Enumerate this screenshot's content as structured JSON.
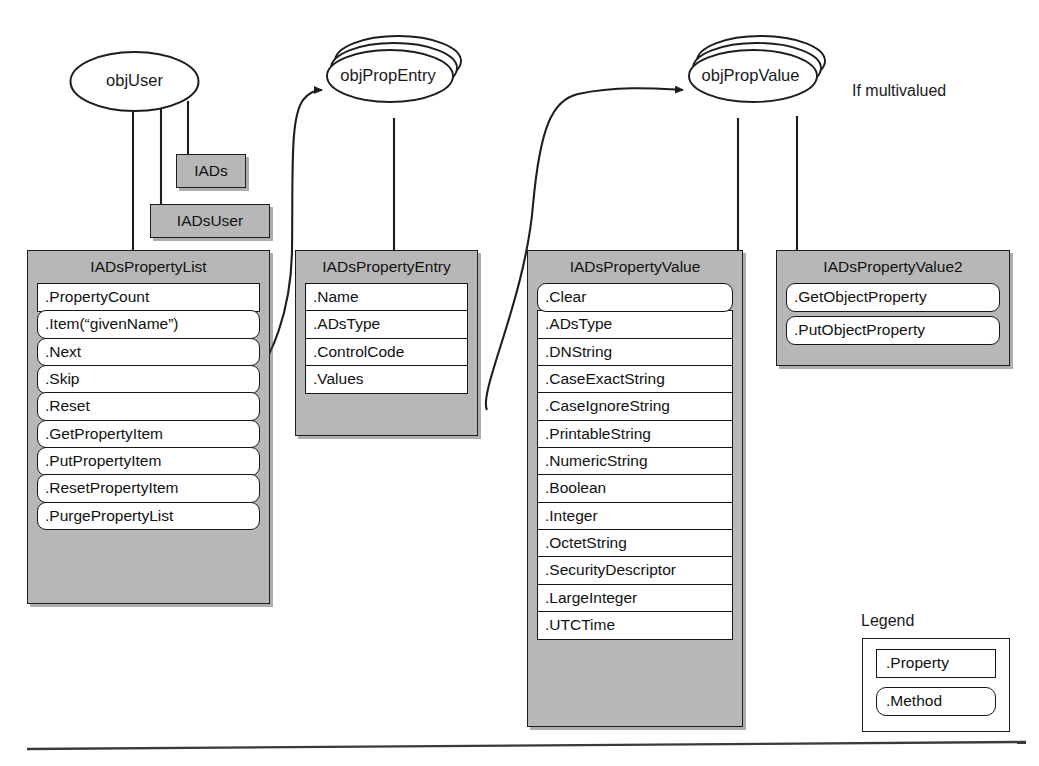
{
  "diagram": {
    "objects": [
      {
        "id": "objUser",
        "label": "objUser",
        "stacked": false
      },
      {
        "id": "objPropEntry",
        "label": "objPropEntry",
        "stacked": true
      },
      {
        "id": "objPropValue",
        "label": "objPropValue",
        "stacked": true
      }
    ],
    "tags": [
      {
        "id": "iads",
        "label": "IADs"
      },
      {
        "id": "iadsuser",
        "label": "IADsUser"
      }
    ],
    "annotations": [
      {
        "id": "if-multivalued",
        "text": "If multivalued"
      }
    ],
    "interfaces": [
      {
        "id": "iadspropertylist",
        "title": "IADsPropertyList",
        "members": [
          {
            "label": ".PropertyCount",
            "kind": "property"
          },
          {
            "label": ".Item(“givenName”)",
            "kind": "method"
          },
          {
            "label": ".Next",
            "kind": "method"
          },
          {
            "label": ".Skip",
            "kind": "method"
          },
          {
            "label": ".Reset",
            "kind": "method"
          },
          {
            "label": ".GetPropertyItem",
            "kind": "method"
          },
          {
            "label": ".PutPropertyItem",
            "kind": "method"
          },
          {
            "label": ".ResetPropertyItem",
            "kind": "method"
          },
          {
            "label": ".PurgePropertyList",
            "kind": "method"
          }
        ]
      },
      {
        "id": "iadspropertyentry",
        "title": "IADsPropertyEntry",
        "members": [
          {
            "label": ".Name",
            "kind": "property"
          },
          {
            "label": ".ADsType",
            "kind": "property"
          },
          {
            "label": ".ControlCode",
            "kind": "property"
          },
          {
            "label": ".Values",
            "kind": "property"
          }
        ]
      },
      {
        "id": "iadspropertyvalue",
        "title": "IADsPropertyValue",
        "members": [
          {
            "label": ".Clear",
            "kind": "method"
          },
          {
            "label": ".ADsType",
            "kind": "property"
          },
          {
            "label": ".DNString",
            "kind": "property"
          },
          {
            "label": ".CaseExactString",
            "kind": "property"
          },
          {
            "label": ".CaseIgnoreString",
            "kind": "property"
          },
          {
            "label": ".PrintableString",
            "kind": "property"
          },
          {
            "label": ".NumericString",
            "kind": "property"
          },
          {
            "label": ".Boolean",
            "kind": "property"
          },
          {
            "label": ".Integer",
            "kind": "property"
          },
          {
            "label": ".OctetString",
            "kind": "property"
          },
          {
            "label": ".SecurityDescriptor",
            "kind": "property"
          },
          {
            "label": ".LargeInteger",
            "kind": "property"
          },
          {
            "label": ".UTCTime",
            "kind": "property"
          }
        ]
      },
      {
        "id": "iadspropertyvalue2",
        "title": "IADsPropertyValue2",
        "members": [
          {
            "label": ".GetObjectProperty",
            "kind": "method"
          },
          {
            "label": ".PutObjectProperty",
            "kind": "method"
          }
        ]
      }
    ],
    "legend": {
      "title": "Legend",
      "items": [
        {
          "label": ".Property",
          "kind": "property"
        },
        {
          "label": ".Method",
          "kind": "method"
        }
      ]
    },
    "colors": {
      "panel_fill": "#b7b7b7",
      "member_fill": "#ffffff",
      "stroke": "#1d1d1d",
      "background": "#ffffff"
    }
  }
}
